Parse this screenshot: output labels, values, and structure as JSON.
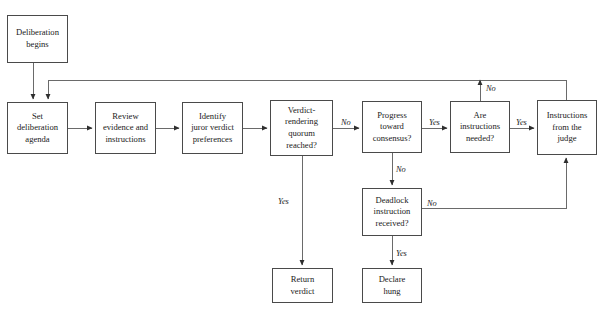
{
  "diagram": {
    "line_color": "#4a4a4a",
    "text_color": "#1a1a1a",
    "background": "#ffffff",
    "top_artifact": "",
    "nodes": [
      {
        "id": "deliberation-begins",
        "label": "Deliberation\nbegins",
        "x": 7,
        "y": 15,
        "w": 61,
        "h": 48
      },
      {
        "id": "set-agenda",
        "label": "Set\ndeliberation\nagenda",
        "x": 7,
        "y": 102,
        "w": 61,
        "h": 52
      },
      {
        "id": "review-evidence",
        "label": "Review\nevidence and\ninstructions",
        "x": 95,
        "y": 102,
        "w": 61,
        "h": 52
      },
      {
        "id": "identify-preferences",
        "label": "Identify\njuror verdict\npreferences",
        "x": 182,
        "y": 102,
        "w": 61,
        "h": 52
      },
      {
        "id": "quorum-reached",
        "label": "Verdict-\nrendering\nquorum\nreached?",
        "x": 270,
        "y": 100,
        "w": 63,
        "h": 56
      },
      {
        "id": "progress-consensus",
        "label": "Progress\ntoward\nconsensus?",
        "x": 362,
        "y": 101,
        "w": 60,
        "h": 52
      },
      {
        "id": "instructions-needed",
        "label": "Are\ninstructions\nneeded?",
        "x": 450,
        "y": 101,
        "w": 60,
        "h": 52
      },
      {
        "id": "instructions-judge",
        "label": "Instructions\nfrom the\njudge",
        "x": 537,
        "y": 100,
        "w": 60,
        "h": 55
      },
      {
        "id": "deadlock-received",
        "label": "Deadlock\ninstruction\nreceived?",
        "x": 362,
        "y": 188,
        "w": 60,
        "h": 48
      },
      {
        "id": "return-verdict",
        "label": "Return\nverdict",
        "x": 272,
        "y": 268,
        "w": 61,
        "h": 35
      },
      {
        "id": "declare-hung",
        "label": "Declare\nhung",
        "x": 362,
        "y": 268,
        "w": 60,
        "h": 35
      }
    ],
    "edge_labels": [
      {
        "id": "quorum-no",
        "text": "No",
        "x": 341,
        "y": 118
      },
      {
        "id": "quorum-yes",
        "text": "Yes",
        "x": 278,
        "y": 197
      },
      {
        "id": "progress-yes",
        "text": "Yes",
        "x": 429,
        "y": 118
      },
      {
        "id": "progress-no",
        "text": "No",
        "x": 396,
        "y": 165
      },
      {
        "id": "instructions-yes",
        "text": "Yes",
        "x": 516,
        "y": 118
      },
      {
        "id": "instructions-no",
        "text": "No",
        "x": 486,
        "y": 84
      },
      {
        "id": "deadlock-no",
        "text": "No",
        "x": 427,
        "y": 199
      },
      {
        "id": "deadlock-yes",
        "text": "Yes",
        "x": 396,
        "y": 249
      }
    ],
    "connectors": [
      {
        "id": "begin-to-agenda",
        "from": "deliberation-begins",
        "to": "set-agenda"
      },
      {
        "id": "agenda-to-review",
        "from": "set-agenda",
        "to": "review-evidence"
      },
      {
        "id": "review-to-identify",
        "from": "review-evidence",
        "to": "identify-preferences"
      },
      {
        "id": "identify-to-quorum",
        "from": "identify-preferences",
        "to": "quorum-reached"
      },
      {
        "id": "quorum-no-to-progress",
        "from": "quorum-reached",
        "to": "progress-consensus"
      },
      {
        "id": "quorum-yes-to-return",
        "from": "quorum-reached",
        "to": "return-verdict"
      },
      {
        "id": "progress-yes-to-instr",
        "from": "progress-consensus",
        "to": "instructions-needed"
      },
      {
        "id": "progress-no-to-deadlock",
        "from": "progress-consensus",
        "to": "deadlock-received"
      },
      {
        "id": "instr-yes-to-judge",
        "from": "instructions-needed",
        "to": "instructions-judge"
      },
      {
        "id": "instr-no-to-agenda",
        "from": "instructions-needed",
        "to": "set-agenda"
      },
      {
        "id": "deadlock-yes-to-hung",
        "from": "deadlock-received",
        "to": "declare-hung"
      },
      {
        "id": "deadlock-no-to-judge",
        "from": "deadlock-received",
        "to": "instructions-judge"
      },
      {
        "id": "judge-to-agenda",
        "from": "instructions-judge",
        "to": "set-agenda"
      }
    ]
  }
}
